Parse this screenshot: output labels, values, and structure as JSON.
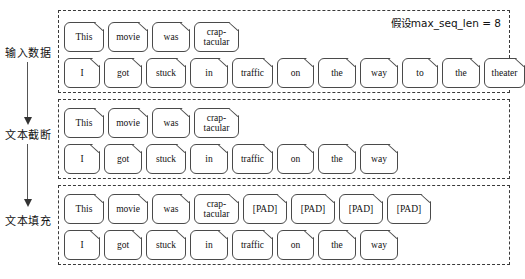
{
  "diagram": {
    "note": "假设max_seq_len = 8",
    "stages": [
      {
        "label": "输入数据",
        "rows": [
          {
            "tokens": [
              "This",
              "movie",
              "was",
              "crap-tacular"
            ]
          },
          {
            "tokens": [
              "I",
              "got",
              "stuck",
              "in",
              "traffic",
              "on",
              "the",
              "way",
              "to",
              "the",
              "theater"
            ]
          }
        ]
      },
      {
        "label": "文本截断",
        "rows": [
          {
            "tokens": [
              "This",
              "movie",
              "was",
              "crap-tacular"
            ]
          },
          {
            "tokens": [
              "I",
              "got",
              "stuck",
              "in",
              "traffic",
              "on",
              "the",
              "way"
            ]
          }
        ]
      },
      {
        "label": "文本填充",
        "rows": [
          {
            "tokens": [
              "This",
              "movie",
              "was",
              "crap-tacular",
              "[PAD]",
              "[PAD]",
              "[PAD]",
              "[PAD]"
            ]
          },
          {
            "tokens": [
              "I",
              "got",
              "stuck",
              "in",
              "traffic",
              "on",
              "the",
              "way"
            ]
          }
        ]
      }
    ],
    "colors": {
      "token_border": "#4a4a4a",
      "section_border": "#3a3a3a",
      "arrow": "#333333",
      "text": "#111111",
      "background": "#ffffff"
    }
  }
}
